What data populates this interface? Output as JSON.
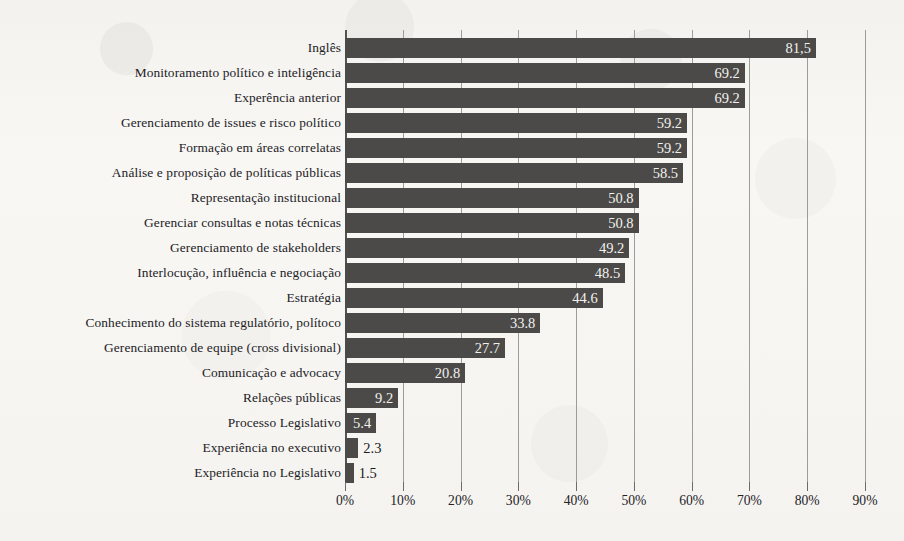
{
  "chart_data": {
    "type": "bar",
    "orientation": "horizontal",
    "title": "",
    "subtitle": "",
    "xlabel": "",
    "ylabel": "",
    "xlim": [
      0,
      90
    ],
    "xticks": [
      0,
      10,
      20,
      30,
      40,
      50,
      60,
      70,
      80,
      90
    ],
    "xtick_labels": [
      "0%",
      "10%",
      "20%",
      "30%",
      "40%",
      "50%",
      "60%",
      "70%",
      "80%",
      "90%"
    ],
    "grid": true,
    "legend": null,
    "bar_color": "#4b4a48",
    "background_color": "#f7f6f3",
    "categories": [
      "Inglês",
      "Monitoramento político e inteligência",
      "Experência anterior",
      "Gerenciamento de issues e risco político",
      "Formação em áreas correlatas",
      "Análise e proposição de políticas públicas",
      "Representação institucional",
      "Gerenciar consultas e notas técnicas",
      "Gerenciamento de stakeholders",
      "Interlocução, influência e negociação",
      "Estratégia",
      "Conhecimento do sistema regulatório, polítoco",
      "Gerenciamento de equipe (cross divisional)",
      "Comunicação e advocacy",
      "Relações públicas",
      "Processo Legislativo",
      "Experiência no executivo",
      "Experiência no Legislativo"
    ],
    "values": [
      81.5,
      69.2,
      69.2,
      59.2,
      59.2,
      58.5,
      50.8,
      50.8,
      49.2,
      48.5,
      44.6,
      33.8,
      27.7,
      20.8,
      9.2,
      5.4,
      2.3,
      1.5
    ],
    "value_labels": [
      "81,5",
      "69.2",
      "69.2",
      "59.2",
      "59.2",
      "58.5",
      "50.8",
      "50.8",
      "49.2",
      "48.5",
      "44.6",
      "33.8",
      "27.7",
      "20.8",
      "9.2",
      "5.4",
      "2.3",
      "1.5"
    ],
    "label_placement": [
      "inside",
      "inside",
      "inside",
      "inside",
      "inside",
      "inside",
      "inside",
      "inside",
      "inside",
      "inside",
      "inside",
      "inside",
      "inside",
      "inside",
      "inside",
      "inside",
      "outside",
      "outside"
    ]
  }
}
